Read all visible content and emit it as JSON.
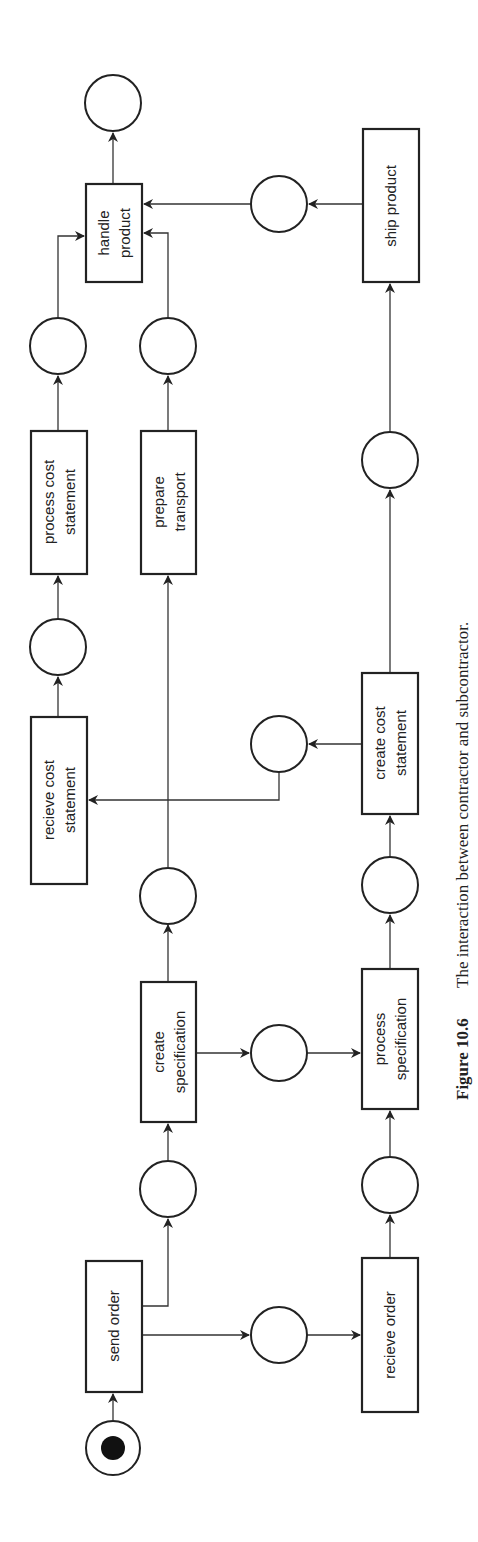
{
  "figure": {
    "type": "petri-net",
    "orientation": "rotated-90-ccw",
    "caption_number": "Figure 10.6",
    "caption_text": "The interaction between contractor and subcontractor."
  },
  "transitions": {
    "send_order": [
      "send order"
    ],
    "create_specification": [
      "create",
      "specification"
    ],
    "recieve_cost_statement": [
      "recieve cost",
      "statement"
    ],
    "process_cost_statement": [
      "process cost",
      "statement"
    ],
    "prepare_transport": [
      "prepare",
      "transport"
    ],
    "handle_product": [
      "handle",
      "product"
    ],
    "recieve_order": [
      "recieve order"
    ],
    "process_specification": [
      "process",
      "specification"
    ],
    "create_cost_statement": [
      "create cost",
      "statement"
    ],
    "ship_product": [
      "ship product"
    ]
  },
  "places": {
    "count": 16,
    "initial_marking": "start place holds 1 token"
  },
  "colors": {
    "stroke": "#222222",
    "background": "#ffffff"
  }
}
